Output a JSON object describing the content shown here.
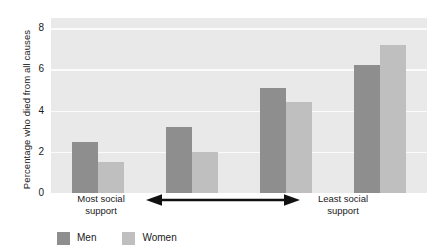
{
  "chart_data": {
    "type": "bar",
    "title": "",
    "subtitle": "",
    "xlabel": "",
    "ylabel": "Percentage who died from all causes",
    "ylim": [
      0,
      8.5
    ],
    "yticks": [
      0,
      2,
      4,
      6,
      8
    ],
    "ytick_labels": [
      "0",
      "2",
      "4",
      "6",
      "8"
    ],
    "grid": "horizontal",
    "legend_position": "bottom-left",
    "categories": [
      "Group 1",
      "Group 2",
      "Group 3",
      "Group 4"
    ],
    "series": [
      {
        "name": "Men",
        "color": "#8e8e8e",
        "values": [
          2.5,
          3.2,
          5.1,
          6.2
        ]
      },
      {
        "name": "Women",
        "color": "#bfbfbf",
        "values": [
          1.5,
          2.0,
          4.4,
          7.2
        ]
      }
    ],
    "annotations": {
      "axis_left_label": "Most social support",
      "axis_right_label": "Least social support",
      "axis_arrow": "double-headed-horizontal-arrow"
    }
  },
  "axis": {
    "y_title": "Percentage who died from all causes",
    "left_label_line1": "Most social",
    "left_label_line2": "support",
    "right_label_line1": "Least social",
    "right_label_line2": "support"
  },
  "legend": {
    "items": [
      {
        "label": "Men",
        "color": "#8e8e8e"
      },
      {
        "label": "Women",
        "color": "#bfbfbf"
      }
    ]
  },
  "colors": {
    "plot_background": "#e9e9e9",
    "gridline": "#fbfbfb",
    "men": "#8e8e8e",
    "women": "#bfbfbf",
    "text": "#1a1a1a",
    "arrow": "#111111"
  }
}
